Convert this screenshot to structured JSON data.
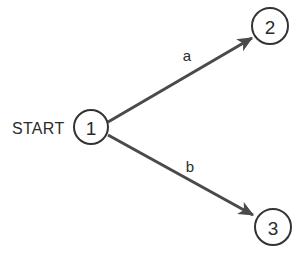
{
  "diagram": {
    "type": "state-transition-diagram",
    "background_color": "#ffffff",
    "node_stroke_color": "#333333",
    "edge_stroke_color": "#4a4a4a",
    "text_color": "#2b2b2b",
    "start_marker": {
      "label": "START",
      "x": 12,
      "y": 128,
      "points_to": "1"
    },
    "nodes": [
      {
        "id": "1",
        "label": "1",
        "cx": 91,
        "cy": 127,
        "r": 17
      },
      {
        "id": "2",
        "label": "2",
        "cx": 270,
        "cy": 26,
        "r": 18
      },
      {
        "id": "3",
        "label": "3",
        "cx": 273,
        "cy": 227,
        "r": 18
      }
    ],
    "edges": [
      {
        "id": "edge-a",
        "label": "a",
        "from": "1",
        "to": "2",
        "x1": 108,
        "y1": 122,
        "x2": 252,
        "y2": 38,
        "label_x": 187,
        "label_y": 55,
        "directed": true
      },
      {
        "id": "edge-b",
        "label": "b",
        "from": "1",
        "to": "3",
        "x1": 108,
        "y1": 135,
        "x2": 253,
        "y2": 215,
        "label_x": 190,
        "label_y": 166,
        "directed": true
      }
    ]
  }
}
